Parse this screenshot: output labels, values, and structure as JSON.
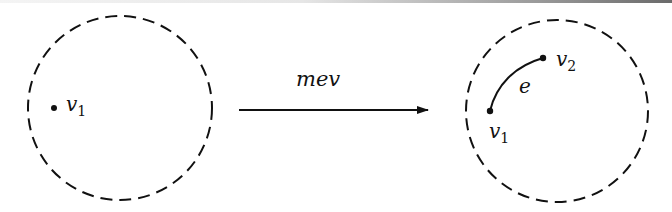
{
  "diagram": {
    "operation": {
      "label": "mev"
    },
    "before": {
      "region": "dashed-circle",
      "vertices": [
        {
          "name": "v",
          "subscript": "1"
        }
      ]
    },
    "after": {
      "region": "dashed-circle",
      "vertices": [
        {
          "name": "v",
          "subscript": "1"
        },
        {
          "name": "v",
          "subscript": "2"
        }
      ],
      "edges": [
        {
          "label": "e",
          "from": "v1",
          "to": "v2"
        }
      ]
    },
    "colors": {
      "stroke": "#111111",
      "background": "#ffffff"
    }
  }
}
